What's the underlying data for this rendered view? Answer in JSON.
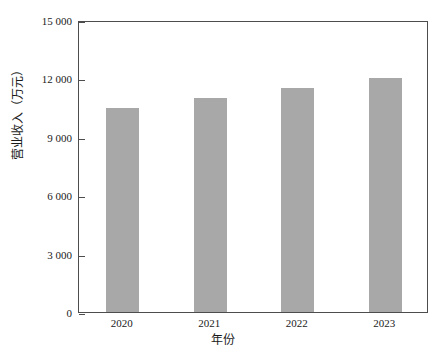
{
  "chart_data": {
    "type": "bar",
    "title": "",
    "subtitle": "",
    "categories": [
      "2020",
      "2021",
      "2022",
      "2023"
    ],
    "values": [
      10500,
      11000,
      11500,
      12000
    ],
    "series": [
      {
        "name": "营业收入",
        "values": [
          10500,
          11000,
          11500,
          12000
        ]
      }
    ],
    "xlabel": "年份",
    "ylabel": "营业收入（万元）",
    "ylim": [
      0,
      15000
    ],
    "yticks": [
      0,
      3000,
      6000,
      9000,
      12000,
      15000
    ],
    "ytick_labels": [
      "0",
      "3 000",
      "6 000",
      "9 000",
      "12 000",
      "15 000"
    ],
    "xtick_labels": [
      "2020",
      "2021",
      "2022",
      "2023"
    ],
    "grid": false,
    "legend": false,
    "legend_position": "none",
    "bar_color": "#a8a8a8",
    "axis_color": "#4d4d4d",
    "background_color": "#ffffff",
    "annotations": []
  },
  "axes": {
    "y_title": "营业收入（万元）",
    "x_title": "年份",
    "y_ticks": [
      {
        "label": "15 000",
        "value": 15000
      },
      {
        "label": "12 000",
        "value": 12000
      },
      {
        "label": "9 000",
        "value": 9000
      },
      {
        "label": "6 000",
        "value": 6000
      },
      {
        "label": "3 000",
        "value": 3000
      },
      {
        "label": "0",
        "value": 0
      }
    ],
    "x_ticks": [
      {
        "label": "2020"
      },
      {
        "label": "2021"
      },
      {
        "label": "2022"
      },
      {
        "label": "2023"
      }
    ]
  }
}
